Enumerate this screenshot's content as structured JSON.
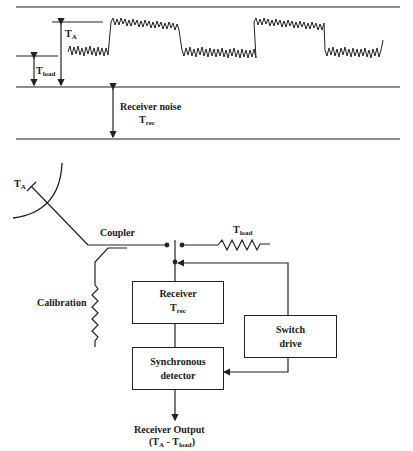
{
  "signal_plot": {
    "labels": {
      "t_a": {
        "main": "T",
        "sub": "A"
      },
      "t_load": {
        "main": "T",
        "sub": "load"
      },
      "receiver_noise": "Receiver noise",
      "t_rec": {
        "main": "T",
        "sub": "rec"
      }
    }
  },
  "block_diagram": {
    "antenna_label": {
      "main": "T",
      "sub": "A"
    },
    "coupler_label": "Coupler",
    "calibration_label": "Calibration",
    "load_label": {
      "main": "T",
      "sub": "load"
    },
    "receiver_box": {
      "line1": "Receiver",
      "line2_main": "T",
      "line2_sub": "rec"
    },
    "switch_drive_box": {
      "line1": "Switch",
      "line2": "drive"
    },
    "detector_box": {
      "line1": "Synchronous",
      "line2": "detector"
    },
    "output_label": {
      "line1": "Receiver Output",
      "open": "(T",
      "sub_a": "A",
      "minus": " - T",
      "sub_load": "load",
      "close": ")"
    }
  },
  "colors": {
    "ink": "#222222",
    "background": "#ffffff"
  }
}
